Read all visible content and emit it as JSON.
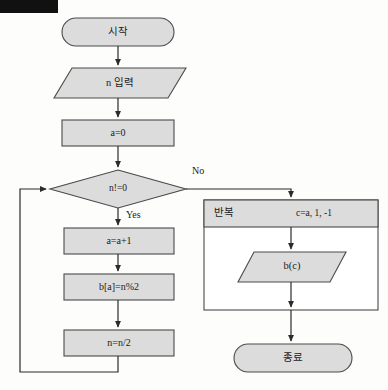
{
  "diagram": {
    "type": "flowchart",
    "redaction": {
      "name": "redaction-bar",
      "color": "#111111"
    },
    "palette": {
      "shape_fill": "#dcdcdc",
      "shape_stroke": "#4a4a4a",
      "connector": "#2b2b2b",
      "text": "#1b1b1b",
      "background": "#fdfdfc"
    },
    "nodes": [
      {
        "id": "start",
        "shape": "terminal",
        "label": "시작"
      },
      {
        "id": "input_n",
        "shape": "parallelogram",
        "label": "n 입력"
      },
      {
        "id": "init_a",
        "shape": "process",
        "label": "a=0"
      },
      {
        "id": "cond",
        "shape": "decision",
        "label": "n!=0"
      },
      {
        "id": "incr_a",
        "shape": "process",
        "label": "a=a+1"
      },
      {
        "id": "store_bit",
        "shape": "process",
        "label": "b[a]=n%2"
      },
      {
        "id": "halve_n",
        "shape": "process",
        "label": "n=n/2"
      },
      {
        "id": "loop_box",
        "shape": "loop",
        "label": "반복",
        "range": "c=a, 1, -1"
      },
      {
        "id": "output_bc",
        "shape": "parallelogram",
        "label": "b(c)"
      },
      {
        "id": "end",
        "shape": "terminal",
        "label": "종료"
      }
    ],
    "branch_labels": {
      "no": "No",
      "yes": "Yes"
    }
  }
}
